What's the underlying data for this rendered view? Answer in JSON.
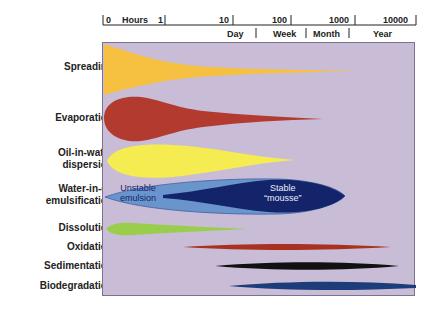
{
  "axis": {
    "top_ticks": [
      {
        "label": "0",
        "x": 103
      },
      {
        "label": "Hours",
        "x": 120
      },
      {
        "label": "1",
        "x": 160
      },
      {
        "label": "10",
        "x": 222
      },
      {
        "label": "100",
        "x": 276
      },
      {
        "label": "1000",
        "x": 333
      },
      {
        "label": "10000",
        "x": 385
      }
    ],
    "bottom_ticks": [
      {
        "label": "Day",
        "x": 226
      },
      {
        "label": "Week",
        "x": 272
      },
      {
        "label": "Month",
        "x": 316
      },
      {
        "label": "Year",
        "x": 376
      }
    ]
  },
  "processes": [
    {
      "name": "Spreading",
      "color": "#f6c040"
    },
    {
      "name": "Evaporation",
      "color": "#b23a2e"
    },
    {
      "name": "Oil-in-water dispersion",
      "line1": "Oil-in-water",
      "line2": "dispersion",
      "color": "#f4ec50"
    },
    {
      "name": "Water-in-oil emulsification",
      "line1": "Water-in-oil",
      "line2": "emulsification",
      "color": "#6a94cc"
    },
    {
      "name": "Dissolution",
      "color": "#9acd4c"
    },
    {
      "name": "Oxidation",
      "color": "#a8321f"
    },
    {
      "name": "Sedimentation",
      "color": "#111111"
    },
    {
      "name": "Biodegradation",
      "color": "#1d3c7a"
    }
  ],
  "emulsion": {
    "unstable_line1": "Unstable",
    "unstable_line2": "emulsion",
    "stable_line1": "Stable",
    "stable_line2": "“mousse”",
    "light_color": "#6a94cc",
    "dark_color": "#13246b"
  },
  "plot_background": "#c9bcd6"
}
